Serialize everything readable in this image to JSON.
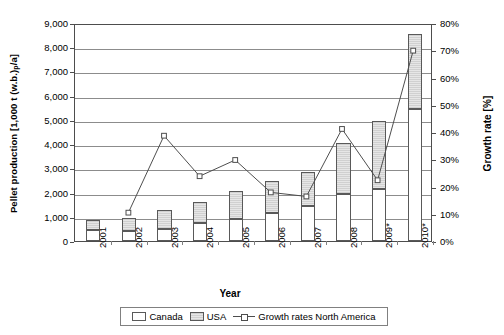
{
  "chart_data": {
    "type": "bar",
    "title": "",
    "xlabel": "Year",
    "ylabel": "Pellet production [1,000 t (w.b.)p/a]",
    "ylabel_main": "Pellet production [1,000 t (w.b.)",
    "ylabel_sub": "p",
    "ylabel_tail": "/a]",
    "y2label": "Growth rate [%]",
    "categories": [
      "2001",
      "2002",
      "2003",
      "2004",
      "2005",
      "2006",
      "2007",
      "2008",
      "2009*",
      "2010*"
    ],
    "ylim": [
      0,
      9000
    ],
    "y2lim": [
      0,
      80
    ],
    "yticks": [
      "0",
      "1,000",
      "2,000",
      "3,000",
      "4,000",
      "5,000",
      "6,000",
      "7,000",
      "8,000",
      "9,000"
    ],
    "ytick_values": [
      0,
      1000,
      2000,
      3000,
      4000,
      5000,
      6000,
      7000,
      8000,
      9000
    ],
    "y2ticks": [
      "0%",
      "10%",
      "20%",
      "30%",
      "40%",
      "50%",
      "60%",
      "70%",
      "80%"
    ],
    "y2tick_values": [
      0,
      10,
      20,
      30,
      40,
      50,
      60,
      70,
      80
    ],
    "grid": true,
    "legend_position": "bottom",
    "series": [
      {
        "name": "Canada",
        "type": "bar-stacked",
        "color": "#ffffff",
        "values": [
          450,
          400,
          500,
          750,
          900,
          1150,
          1450,
          1950,
          2150,
          5450
        ]
      },
      {
        "name": "USA",
        "type": "bar-stacked",
        "color": "#d9d9d9",
        "values": [
          400,
          550,
          800,
          850,
          1180,
          1320,
          1420,
          2100,
          2800,
          3100
        ]
      },
      {
        "name": "Growth rates North America",
        "type": "line",
        "axis": "secondary",
        "color": "#4d4d4d",
        "marker": "open-square",
        "values": [
          null,
          10.5,
          39,
          24,
          30,
          18,
          16.5,
          41.5,
          22.5,
          70.5
        ]
      }
    ],
    "totals": [
      850,
      950,
      1300,
      1600,
      2080,
      2470,
      2870,
      4050,
      4950,
      8550
    ]
  },
  "legend": {
    "items": [
      {
        "label": "Canada",
        "swatch": "white-box"
      },
      {
        "label": "USA",
        "swatch": "gray-box"
      },
      {
        "label": "Growth rates North America",
        "swatch": "line-marker"
      }
    ]
  }
}
